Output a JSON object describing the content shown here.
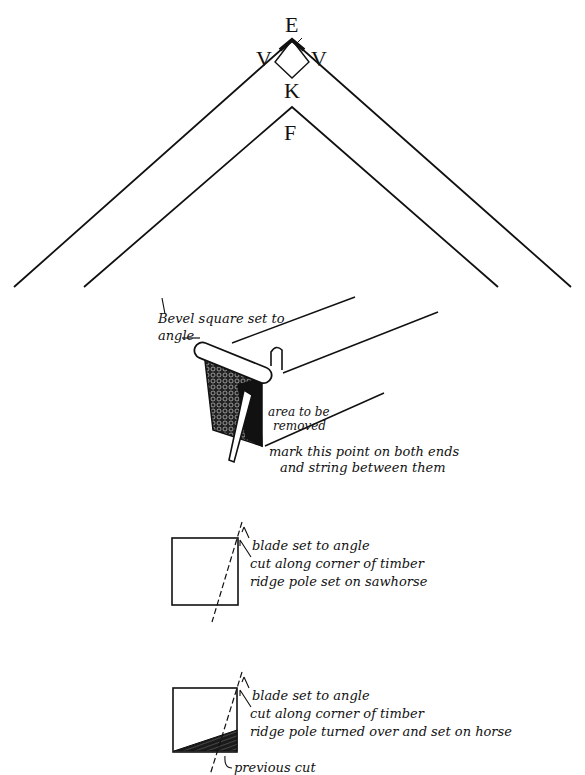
{
  "roof": {
    "labels": {
      "E": "E",
      "V_left": "V",
      "V_right": "V",
      "K": "K",
      "F": "F"
    }
  },
  "bevel_figure": {
    "label_bevel_line1": "Bevel square set to",
    "label_bevel_line2": "angle",
    "label_area_line1": "area to be",
    "label_area_line2": "removed",
    "label_mark_line1": "mark this point on both ends",
    "label_mark_line2": "and string between them"
  },
  "cut_figure_1": {
    "line1": "blade set to angle",
    "line2": "cut along corner of timber",
    "line3": "ridge pole set on sawhorse"
  },
  "cut_figure_2": {
    "line1": "blade set to angle",
    "line2": "cut along corner of timber",
    "line3": "ridge pole turned over and set on horse",
    "line4": "previous cut"
  },
  "colors": {
    "ink": "#111111",
    "paper": "#ffffff"
  }
}
